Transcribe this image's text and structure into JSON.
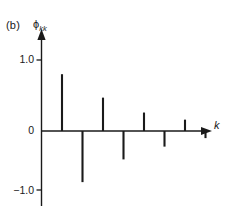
{
  "figure": {
    "panel_label": "(b)",
    "y_axis_label_base": "ϕ",
    "y_axis_label_sub": "kk",
    "x_axis_label": "k",
    "tick_positive": "1.0",
    "tick_zero": "0",
    "tick_negative": "−1.0",
    "line_color": "#1a1a1a",
    "background_color": "#ffffff"
  },
  "chart_data": {
    "type": "bar",
    "title": "(b)",
    "subtitle": "",
    "xlabel": "k",
    "ylabel": "ϕkk",
    "categories": [
      "1",
      "2",
      "3",
      "4",
      "5",
      "6",
      "7",
      "8"
    ],
    "x": [
      1,
      2,
      3,
      4,
      5,
      6,
      7,
      8
    ],
    "values": [
      0.8,
      -0.72,
      0.47,
      -0.4,
      0.26,
      -0.22,
      0.16,
      -0.1
    ],
    "series": [
      {
        "name": "partial autocorrelation",
        "values": [
          0.8,
          -0.72,
          0.47,
          -0.4,
          0.26,
          -0.22,
          0.16,
          -0.1
        ]
      }
    ],
    "ylim": [
      -1.3,
      1.15
    ],
    "xlim": [
      0,
      9.2
    ],
    "ytick_values": [
      1.0,
      0,
      -1.0
    ],
    "ytick_labels": [
      "1.0",
      "0",
      "−1.0"
    ],
    "xtick_values": [],
    "xtick_labels": [],
    "grid": false,
    "legend": null,
    "legend_position": "none",
    "annotations": [
      {
        "text": "(b)",
        "position": "top-left"
      }
    ],
    "axis_style": "arrow-headed axes, spikes (stem plot) without markers"
  }
}
